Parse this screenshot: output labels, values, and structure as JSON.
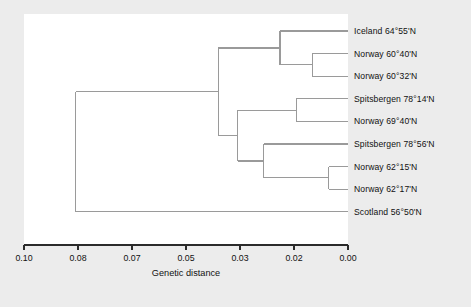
{
  "chart_data": {
    "type": "dendrogram",
    "title": "",
    "xlabel": "Genetic distance",
    "ylabel": "",
    "xlim": [
      0.1,
      0.0
    ],
    "x_axis_reversed": true,
    "grid": false,
    "legend": null,
    "tick_labels": [
      "0.10",
      "0.08",
      "0.07",
      "0.05",
      "0.03",
      "0.02",
      "0.00"
    ],
    "tick_values": [
      0.1,
      0.08,
      0.07,
      0.05,
      0.03,
      0.02,
      0.0
    ],
    "tick_positions_px": [
      24,
      78,
      132,
      186,
      240,
      294,
      348
    ],
    "leaves": [
      {
        "label": "Iceland 64°55'N",
        "order": 1
      },
      {
        "label": "Norway 60°40'N",
        "order": 2
      },
      {
        "label": "Norway 60°32'N",
        "order": 3
      },
      {
        "label": "Spitsbergen 78°14'N",
        "order": 4
      },
      {
        "label": "Norway 69°40'N",
        "order": 5
      },
      {
        "label": "Spitsbergen 78°56'N",
        "order": 6
      },
      {
        "label": "Norway 62°15'N",
        "order": 7
      },
      {
        "label": "Norway 62°17'N",
        "order": 8
      },
      {
        "label": "Scotland 56°50'N",
        "order": 9
      }
    ],
    "merges": [
      {
        "id": "n1",
        "children": [
          "Norway 60°40'N",
          "Norway 60°32'N"
        ],
        "distance": 0.011
      },
      {
        "id": "n2",
        "children": [
          "Iceland 64°55'N",
          "n1"
        ],
        "distance": 0.021
      },
      {
        "id": "n3",
        "children": [
          "Spitsbergen 78°14'N",
          "Norway 69°40'N"
        ],
        "distance": 0.016
      },
      {
        "id": "n4",
        "children": [
          "Norway 62°15'N",
          "Norway 62°17'N"
        ],
        "distance": 0.006
      },
      {
        "id": "n5",
        "children": [
          "Spitsbergen 78°56'N",
          "n4"
        ],
        "distance": 0.026
      },
      {
        "id": "n6",
        "children": [
          "n3",
          "n5"
        ],
        "distance": 0.034
      },
      {
        "id": "n7",
        "children": [
          "n2",
          "n6"
        ],
        "distance": 0.04
      },
      {
        "id": "n8",
        "children": [
          "n7",
          "Scotland 56°50'N"
        ],
        "distance": 0.084
      }
    ]
  },
  "axis": {
    "label": "Genetic distance"
  },
  "colors": {
    "background": "#ececec",
    "plot_background": "#ffffff",
    "line": "#9a9a9a",
    "axis": "#2b2b2b",
    "text": "#111111"
  }
}
